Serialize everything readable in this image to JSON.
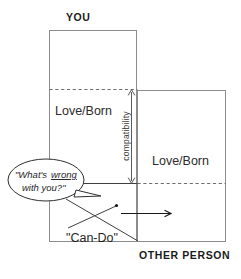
{
  "diagram": {
    "title_you": "YOU",
    "title_other": "OTHER PERSON",
    "left_zone_label": "Love/Born",
    "right_zone_label": "Love/Born",
    "compatibility_label": "compatibility",
    "speech_bubble": {
      "line1_pre": "\"What's ",
      "line1_em": "wrong",
      "line2": "with you?\""
    },
    "can_do_label": "\"Can-Do\"",
    "colors": {
      "box_stroke": "#8c8c8c",
      "dashed_stroke": "#6e6e6e",
      "text": "#1f1f1f",
      "arrow": "#1a1a1a",
      "background": "#ffffff"
    },
    "geometry": {
      "left_box": "x 49-137, y 30-242",
      "right_box": "x 137-226, y 90-242",
      "left_dashed_y": "89",
      "right_dashed_y": "183",
      "compatibility_span": "y 89 to 183"
    }
  }
}
